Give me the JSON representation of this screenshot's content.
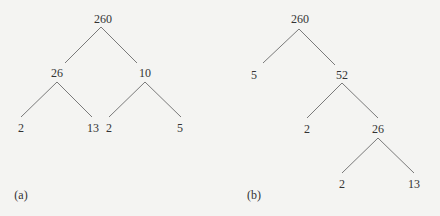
{
  "diagrams": [
    {
      "caption": "(a)",
      "nodes": [
        {
          "id": "a_root",
          "label": "260"
        },
        {
          "id": "a_l",
          "label": "26"
        },
        {
          "id": "a_r",
          "label": "10"
        },
        {
          "id": "a_ll",
          "label": "2"
        },
        {
          "id": "a_lr",
          "label": "13"
        },
        {
          "id": "a_rl",
          "label": "2"
        },
        {
          "id": "a_rr",
          "label": "5"
        }
      ],
      "edges": [
        [
          "a_root",
          "a_l"
        ],
        [
          "a_root",
          "a_r"
        ],
        [
          "a_l",
          "a_ll"
        ],
        [
          "a_l",
          "a_lr"
        ],
        [
          "a_r",
          "a_rl"
        ],
        [
          "a_r",
          "a_rr"
        ]
      ]
    },
    {
      "caption": "(b)",
      "nodes": [
        {
          "id": "b_root",
          "label": "260"
        },
        {
          "id": "b_l",
          "label": "5"
        },
        {
          "id": "b_r",
          "label": "52"
        },
        {
          "id": "b_rl",
          "label": "2"
        },
        {
          "id": "b_rr",
          "label": "26"
        },
        {
          "id": "b_rrl",
          "label": "2"
        },
        {
          "id": "b_rrr",
          "label": "13"
        }
      ],
      "edges": [
        [
          "b_root",
          "b_l"
        ],
        [
          "b_root",
          "b_r"
        ],
        [
          "b_r",
          "b_rl"
        ],
        [
          "b_r",
          "b_rr"
        ],
        [
          "b_rr",
          "b_rrl"
        ],
        [
          "b_rr",
          "b_rrr"
        ]
      ]
    }
  ],
  "colors": {
    "line": "#7a7a7a",
    "text": "#333333",
    "background": "#f4f4f2"
  }
}
